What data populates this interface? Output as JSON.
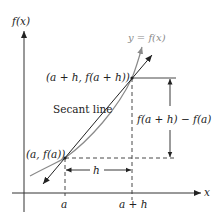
{
  "diagram": {
    "axes": {
      "y_label": "f(x)",
      "x_label": "x"
    },
    "curve_label": "y = f(x)",
    "secant_label": "Secant line",
    "points": [
      {
        "id": "p1",
        "label": "(a, f(a))"
      },
      {
        "id": "p2",
        "label": "(a + h, f(a + h))"
      }
    ],
    "tick_labels": {
      "a": "a",
      "a_plus_h": "a + h"
    },
    "rise_label": "f(a + h) − f(a)",
    "run_label": "h",
    "colors": {
      "curve": "#8a8a8a",
      "secant": "#222222",
      "axes": "#333333",
      "text": "#222222"
    }
  }
}
